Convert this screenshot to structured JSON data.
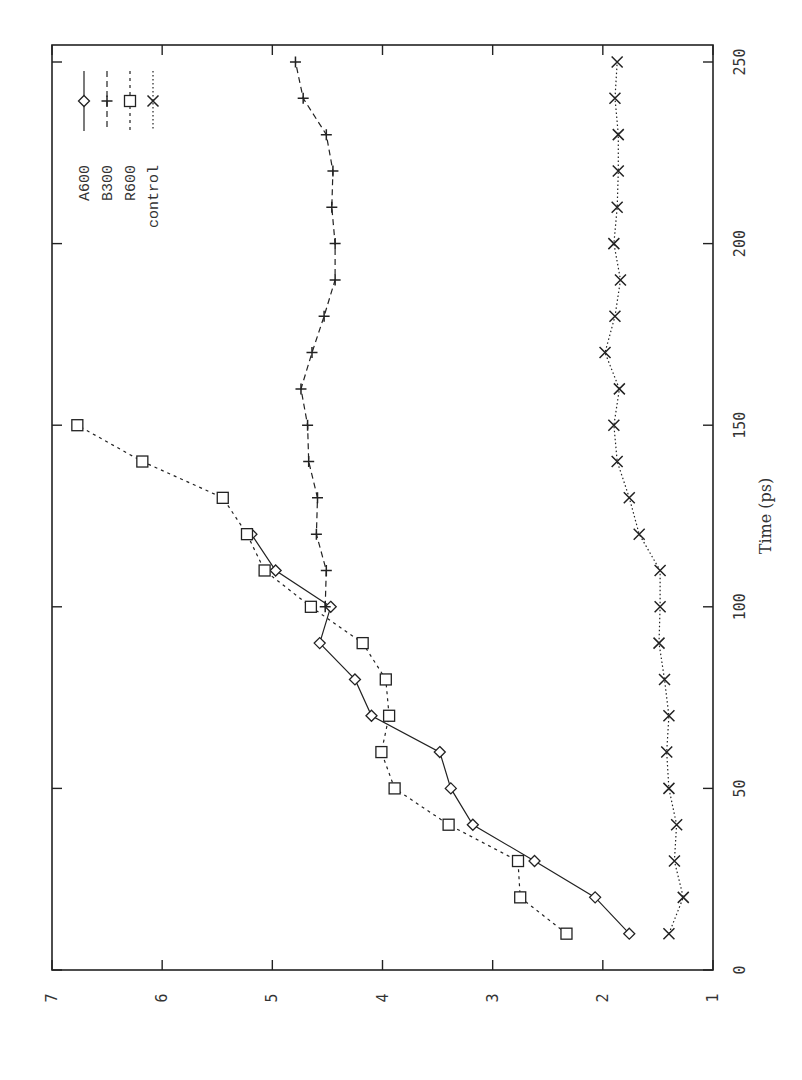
{
  "chart_data": {
    "type": "line",
    "title": "",
    "orientation": "rotated 90 degrees counter-clockwise (time axis vertical, values horizontal, decreasing left-to-right)",
    "xlabel": "Time (ps)",
    "ylabel": "",
    "xlim": [
      0,
      250
    ],
    "ylim": [
      1,
      7
    ],
    "xticks": [
      0,
      50,
      100,
      150,
      200,
      250
    ],
    "yticks": [
      1,
      2,
      3,
      4,
      5,
      6,
      7
    ],
    "grid": false,
    "legend_position": "top-left (inside frame)",
    "series": [
      {
        "name": "A600",
        "marker": "diamond",
        "line": "solid",
        "x": [
          10,
          20,
          30,
          40,
          50,
          60,
          70,
          80,
          90,
          100,
          110,
          120
        ],
        "values": [
          1.76,
          2.07,
          2.62,
          3.18,
          3.38,
          3.48,
          4.1,
          4.25,
          4.57,
          4.47,
          4.97,
          5.19
        ]
      },
      {
        "name": "B300",
        "marker": "plus",
        "line": "dashed",
        "x": [
          100,
          110,
          120,
          130,
          140,
          150,
          160,
          170,
          180,
          190,
          200,
          210,
          220,
          230,
          240,
          250
        ],
        "values": [
          4.52,
          4.51,
          4.6,
          4.59,
          4.67,
          4.68,
          4.74,
          4.64,
          4.53,
          4.43,
          4.43,
          4.46,
          4.45,
          4.51,
          4.72,
          4.79
        ]
      },
      {
        "name": "R600",
        "marker": "square",
        "line": "short-dashed",
        "x": [
          10,
          20,
          30,
          40,
          50,
          60,
          70,
          80,
          90,
          100,
          110,
          120,
          130,
          140,
          150
        ],
        "values": [
          2.33,
          2.75,
          2.77,
          3.4,
          3.89,
          4.01,
          3.94,
          3.97,
          4.18,
          4.65,
          5.07,
          5.23,
          5.45,
          6.18,
          6.77
        ]
      },
      {
        "name": "control",
        "marker": "cross",
        "line": "dotted",
        "x": [
          10,
          20,
          30,
          40,
          50,
          60,
          70,
          80,
          90,
          100,
          110,
          120,
          130,
          140,
          150,
          160,
          170,
          180,
          190,
          200,
          210,
          220,
          230,
          240,
          250
        ],
        "values": [
          1.4,
          1.27,
          1.35,
          1.33,
          1.4,
          1.42,
          1.4,
          1.44,
          1.49,
          1.48,
          1.48,
          1.67,
          1.76,
          1.87,
          1.9,
          1.85,
          1.98,
          1.89,
          1.84,
          1.9,
          1.87,
          1.86,
          1.86,
          1.89,
          1.87
        ]
      }
    ]
  },
  "colors": {
    "ink": "#222222",
    "label": "#333333",
    "background": "#ffffff"
  }
}
